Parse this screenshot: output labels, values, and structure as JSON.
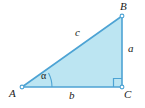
{
  "figure": {
    "type": "right-triangle-diagram",
    "background_color": "#ffffff",
    "fill_color": "#bce5f2",
    "stroke_color": "#4da3d4",
    "label_color": "#1a1a1a",
    "vertices": {
      "A": {
        "label": "A",
        "x": 22,
        "y": 87
      },
      "B": {
        "label": "B",
        "x": 122,
        "y": 16
      },
      "C": {
        "label": "C",
        "x": 122,
        "y": 87
      }
    },
    "sides": {
      "a": {
        "label": "a",
        "description": "vertical-leg-BC"
      },
      "b": {
        "label": "b",
        "description": "horizontal-leg-AC"
      },
      "c": {
        "label": "c",
        "description": "hypotenuse-AB"
      }
    },
    "angle": {
      "label": "α",
      "at_vertex": "A"
    },
    "right_angle": {
      "at_vertex": "C",
      "marker": "square"
    }
  }
}
